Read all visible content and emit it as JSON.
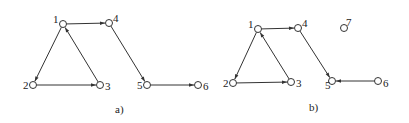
{
  "graphs": [
    {
      "id": "a",
      "caption": "a)",
      "nodes": [
        {
          "id": "1",
          "label": "1"
        },
        {
          "id": "2",
          "label": "2"
        },
        {
          "id": "3",
          "label": "3"
        },
        {
          "id": "4",
          "label": "4"
        },
        {
          "id": "5",
          "label": "5"
        },
        {
          "id": "6",
          "label": "6"
        }
      ],
      "edges": [
        {
          "from": "1",
          "to": "4"
        },
        {
          "from": "1",
          "to": "2"
        },
        {
          "from": "2",
          "to": "3"
        },
        {
          "from": "3",
          "to": "1"
        },
        {
          "from": "4",
          "to": "5"
        },
        {
          "from": "5",
          "to": "6"
        }
      ]
    },
    {
      "id": "b",
      "caption": "b)",
      "nodes": [
        {
          "id": "1",
          "label": "1"
        },
        {
          "id": "2",
          "label": "2"
        },
        {
          "id": "3",
          "label": "3"
        },
        {
          "id": "4",
          "label": "4"
        },
        {
          "id": "5",
          "label": "5"
        },
        {
          "id": "6",
          "label": "6"
        },
        {
          "id": "7",
          "label": "7"
        }
      ],
      "edges": [
        {
          "from": "1",
          "to": "4"
        },
        {
          "from": "1",
          "to": "2"
        },
        {
          "from": "2",
          "to": "3"
        },
        {
          "from": "3",
          "to": "1"
        },
        {
          "from": "4",
          "to": "5"
        },
        {
          "from": "6",
          "to": "5"
        }
      ]
    }
  ]
}
